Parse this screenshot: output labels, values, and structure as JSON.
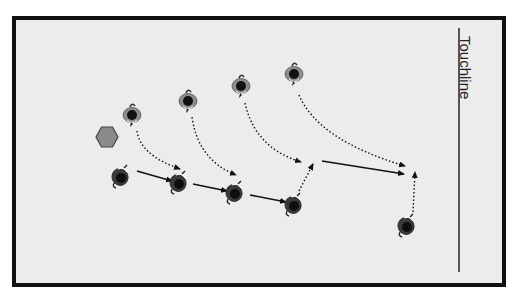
{
  "diagram": {
    "title": "",
    "touchline_label": "Touchline",
    "colors": {
      "pitch_background": "#ececec",
      "border": "#111111",
      "line": "#222222",
      "cone": "#8a8a8a",
      "cone_outline": "#444444",
      "attacker_body": "#8d8d8d",
      "defender_body": "#3a3a3a"
    },
    "cone": {
      "shape": "hexagon",
      "x": 107,
      "y": 137
    },
    "players_top_row": [
      {
        "id": "A1",
        "x": 132,
        "y": 115
      },
      {
        "id": "A2",
        "x": 188,
        "y": 101
      },
      {
        "id": "A3",
        "x": 241,
        "y": 86
      },
      {
        "id": "A4",
        "x": 294,
        "y": 74
      }
    ],
    "players_bottom_row": [
      {
        "id": "B1",
        "x": 120,
        "y": 177
      },
      {
        "id": "B2",
        "x": 178,
        "y": 183
      },
      {
        "id": "B3",
        "x": 234,
        "y": 193
      },
      {
        "id": "B4",
        "x": 293,
        "y": 205
      },
      {
        "id": "B5",
        "x": 406,
        "y": 226
      }
    ],
    "passes_solid": [
      {
        "from": [
          137,
          171
        ],
        "to": [
          172,
          181
        ]
      },
      {
        "from": [
          193,
          184
        ],
        "to": [
          227,
          191
        ]
      },
      {
        "from": [
          250,
          195
        ],
        "to": [
          286,
          202
        ]
      },
      {
        "from": [
          322,
          161
        ],
        "to": [
          404,
          174
        ]
      }
    ],
    "runs_dotted_curved": [
      {
        "from": [
          137,
          131
        ],
        "ctrl": [
          140,
          155
        ],
        "to": [
          180,
          169
        ]
      },
      {
        "from": [
          192,
          117
        ],
        "ctrl": [
          198,
          160
        ],
        "to": [
          236,
          175
        ]
      },
      {
        "from": [
          245,
          103
        ],
        "ctrl": [
          255,
          148
        ],
        "to": [
          301,
          162
        ]
      },
      {
        "from": [
          299,
          95
        ],
        "ctrl": [
          318,
          140
        ],
        "to": [
          405,
          166
        ]
      }
    ],
    "runs_dotted_straight": [
      {
        "from": [
          299,
          191
        ],
        "to": [
          313,
          164
        ]
      },
      {
        "from": [
          413,
          212
        ],
        "to": [
          415,
          172
        ]
      }
    ],
    "touchline": {
      "x": 459,
      "y1": 28,
      "y2": 272
    }
  }
}
